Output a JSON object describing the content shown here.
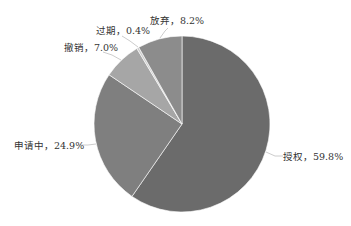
{
  "chart_data": {
    "type": "pie",
    "title": "",
    "start_angle_deg": 0,
    "direction": "clockwise",
    "center": [
      182,
      124
    ],
    "radius": 88,
    "slices": [
      {
        "name": "授权",
        "value": 59.8,
        "label": "授权，59.8%",
        "color": "#6b6b6b"
      },
      {
        "name": "申请中",
        "value": 24.9,
        "label": "申请中，24.9%",
        "color": "#7f7f7f"
      },
      {
        "name": "撤销",
        "value": 7.0,
        "label": "撤销，7.0%",
        "color": "#a6a6a6"
      },
      {
        "name": "过期",
        "value": 0.4,
        "label": "过期，0.4%",
        "color": "#cccccc"
      },
      {
        "name": "放弃",
        "value": 8.2,
        "label": "放弃，8.2%",
        "color": "#8c8c8c"
      }
    ],
    "legend": "none",
    "data_labels": "outside with leader lines"
  },
  "labels": {
    "granted": "授权，59.8%",
    "pending": "申请中，24.9%",
    "revoked": "撤销，7.0%",
    "expired": "过期，0.4%",
    "abandoned": "放弃，8.2%"
  }
}
